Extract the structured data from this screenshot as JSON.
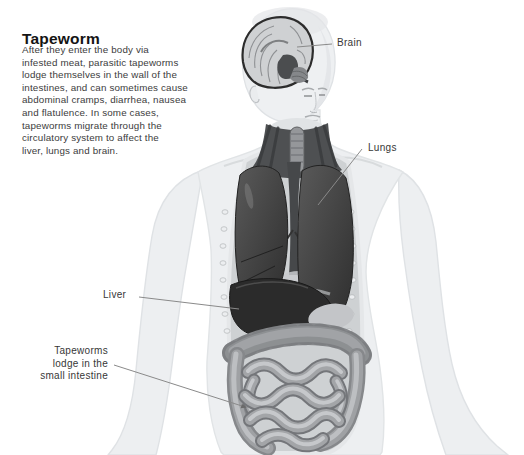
{
  "title": "Tapeworm",
  "description": {
    "lines": [
      "After they enter the body via",
      "infested meat, parasitic tapeworms",
      "lodge themselves in the wall of the",
      "intestines, and can sometimes cause",
      "abdominal cramps, diarrhea, nausea",
      "and flatulence. In some cases,",
      "tapeworms migrate through the",
      "circulatory system to affect the",
      "liver, lungs and brain."
    ]
  },
  "illustration": {
    "type": "anatomical-diagram",
    "subject": "human torso with brain, lungs, liver and intestines exposed",
    "labels": {
      "brain": "Brain",
      "lungs": "Lungs",
      "liver": "Liver",
      "tapeworms_line1": "Tapeworms",
      "tapeworms_line2": "lodge in the",
      "tapeworms_line3": "small intestine"
    }
  },
  "colors": {
    "background": "#ffffff",
    "title_text": "#141414",
    "body_text": "#3c3c3c",
    "label_text": "#373737",
    "leader_line": "#8a8a8a",
    "skin": "#edeff1",
    "cavity": "#ced1d3",
    "lungs": "#3a3a3a",
    "liver": "#2b2b2b",
    "intestine": "#a3a5a8"
  }
}
